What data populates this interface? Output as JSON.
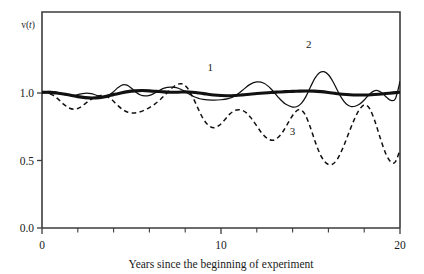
{
  "chart_data": {
    "type": "line",
    "title": "",
    "subtitle": "",
    "xlabel": "Years since the beginning of experiment",
    "ylabel": "v(t)",
    "ylabel_parts": {
      "prefix": "v(",
      "italic": "t",
      "suffix": ")"
    },
    "xlim": [
      0,
      20
    ],
    "ylim": [
      0,
      1.6
    ],
    "xticks": [
      0,
      10,
      20
    ],
    "xticklabels": [
      "0",
      "10",
      "20"
    ],
    "xminorticks": [
      2,
      4,
      6,
      8,
      12,
      14,
      16,
      18
    ],
    "yticks": [
      0.0,
      0.5,
      1.0
    ],
    "yticklabels": [
      "0.0",
      "0.5",
      "1.0"
    ],
    "grid": false,
    "legend_position": "inline-annotations",
    "annotations": [
      {
        "text": "1",
        "x": 9.4,
        "y": 1.16,
        "series": "1"
      },
      {
        "text": "2",
        "x": 14.9,
        "y": 1.33,
        "series": "2"
      },
      {
        "text": "3",
        "x": 14.0,
        "y": 0.69,
        "series": "3"
      }
    ],
    "series": [
      {
        "name": "1",
        "label": "1",
        "style": "thick-solid",
        "color": "#111111",
        "x": [
          0.0,
          0.4,
          0.8,
          1.2,
          1.6,
          2.0,
          2.4,
          2.8,
          3.2,
          3.6,
          4.0,
          4.4,
          4.8,
          5.2,
          5.6,
          6.0,
          6.4,
          6.8,
          7.2,
          7.6,
          8.0,
          8.4,
          8.8,
          9.2,
          9.6,
          10.0,
          10.4,
          10.8,
          11.2,
          11.6,
          12.0,
          12.4,
          12.8,
          13.2,
          13.6,
          14.0,
          14.4,
          14.8,
          15.2,
          15.6,
          16.0,
          16.4,
          16.8,
          17.2,
          17.6,
          18.0,
          18.4,
          18.8,
          19.2,
          19.6,
          20.0
        ],
        "y": [
          1.005,
          1.005,
          1.0,
          0.993,
          0.983,
          0.973,
          0.966,
          0.963,
          0.966,
          0.975,
          0.988,
          1.0,
          1.01,
          1.016,
          1.018,
          1.016,
          1.012,
          1.008,
          1.006,
          1.006,
          1.008,
          1.006,
          1.0,
          0.992,
          0.985,
          0.981,
          0.98,
          0.982,
          0.986,
          0.991,
          0.996,
          1.0,
          1.004,
          1.007,
          1.01,
          1.012,
          1.014,
          1.015,
          1.014,
          1.01,
          1.004,
          0.997,
          0.991,
          0.987,
          0.985,
          0.985,
          0.987,
          0.991,
          0.996,
          1.001,
          1.006
        ]
      },
      {
        "name": "2",
        "label": "2",
        "style": "thin-solid",
        "color": "#111111",
        "x": [
          0.0,
          0.25,
          0.5,
          0.75,
          1.0,
          1.25,
          1.5,
          1.75,
          2.0,
          2.25,
          2.5,
          2.75,
          3.0,
          3.25,
          3.5,
          3.75,
          4.0,
          4.25,
          4.5,
          4.75,
          5.0,
          5.25,
          5.5,
          5.75,
          6.0,
          6.25,
          6.5,
          6.75,
          7.0,
          7.25,
          7.5,
          7.75,
          8.0,
          8.25,
          8.5,
          8.75,
          9.0,
          9.5,
          10.0,
          10.4,
          10.8,
          11.2,
          11.6,
          12.0,
          12.4,
          12.8,
          13.2,
          13.6,
          14.0,
          14.25,
          14.5,
          14.75,
          15.0,
          15.25,
          15.5,
          15.75,
          16.0,
          16.25,
          16.5,
          16.75,
          17.0,
          17.25,
          17.5,
          17.75,
          18.0,
          18.25,
          18.5,
          18.75,
          19.0,
          19.25,
          19.5,
          19.75,
          20.0
        ],
        "y": [
          1.005,
          1.01,
          1.012,
          1.008,
          0.998,
          0.988,
          0.982,
          0.982,
          0.988,
          0.996,
          1.0,
          0.996,
          0.985,
          0.974,
          0.972,
          0.985,
          1.01,
          1.04,
          1.06,
          1.058,
          1.035,
          1.005,
          0.985,
          0.978,
          0.982,
          0.996,
          1.015,
          1.032,
          1.042,
          1.044,
          1.04,
          1.028,
          1.01,
          0.99,
          0.972,
          0.96,
          0.953,
          0.948,
          0.95,
          0.958,
          0.98,
          1.02,
          1.062,
          1.082,
          1.072,
          1.03,
          0.968,
          0.918,
          0.896,
          0.9,
          0.925,
          0.975,
          1.045,
          1.11,
          1.15,
          1.158,
          1.135,
          1.085,
          1.02,
          0.96,
          0.918,
          0.9,
          0.902,
          0.918,
          0.948,
          0.985,
          1.012,
          1.018,
          1.0,
          0.968,
          0.945,
          0.96,
          1.085
        ]
      },
      {
        "name": "3",
        "label": "3",
        "style": "dashed",
        "color": "#111111",
        "x": [
          0.0,
          0.3,
          0.6,
          0.9,
          1.2,
          1.5,
          1.8,
          2.1,
          2.4,
          2.7,
          3.0,
          3.3,
          3.6,
          3.9,
          4.2,
          4.5,
          4.8,
          5.1,
          5.4,
          5.7,
          6.0,
          6.3,
          6.6,
          6.9,
          7.2,
          7.5,
          7.8,
          8.1,
          8.4,
          8.7,
          9.0,
          9.3,
          9.6,
          9.9,
          10.2,
          10.5,
          10.8,
          11.1,
          11.4,
          11.7,
          12.0,
          12.3,
          12.6,
          12.9,
          13.2,
          13.5,
          13.8,
          14.1,
          14.4,
          14.7,
          15.0,
          15.3,
          15.6,
          15.9,
          16.2,
          16.5,
          16.8,
          17.1,
          17.4,
          17.7,
          18.0,
          18.3,
          18.6,
          18.9,
          19.2,
          19.5,
          19.75,
          20.0
        ],
        "y": [
          1.002,
          1.0,
          0.985,
          0.955,
          0.918,
          0.89,
          0.88,
          0.892,
          0.92,
          0.95,
          0.972,
          0.982,
          0.975,
          0.95,
          0.912,
          0.878,
          0.858,
          0.852,
          0.858,
          0.872,
          0.892,
          0.918,
          0.95,
          0.99,
          1.03,
          1.06,
          1.068,
          1.04,
          0.975,
          0.89,
          0.81,
          0.76,
          0.742,
          0.76,
          0.8,
          0.845,
          0.872,
          0.875,
          0.855,
          0.812,
          0.755,
          0.7,
          0.662,
          0.65,
          0.672,
          0.722,
          0.79,
          0.852,
          0.878,
          0.84,
          0.742,
          0.625,
          0.53,
          0.478,
          0.47,
          0.51,
          0.59,
          0.69,
          0.79,
          0.87,
          0.912,
          0.885,
          0.79,
          0.665,
          0.552,
          0.488,
          0.492,
          0.58
        ]
      }
    ]
  },
  "figure": {
    "background": "#ffffff",
    "axis_color": "#3c3c3c",
    "ink_color": "#111111"
  }
}
